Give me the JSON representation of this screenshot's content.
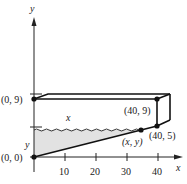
{
  "figure": {
    "axes": {
      "x_label": "x",
      "y_label": "y",
      "x_ticks": [
        "10",
        "20",
        "30",
        "40"
      ]
    },
    "points": {
      "origin": "(0, 0)",
      "top_left": "(0, 9)",
      "top_right": "(40, 9)",
      "bottom_right": "(40, 5)",
      "water_point": "(x, y)"
    },
    "region_labels": {
      "empty_height": "x",
      "water_height": "y"
    },
    "colors": {
      "line": "#111111",
      "shade": "#dcdcdc"
    }
  }
}
